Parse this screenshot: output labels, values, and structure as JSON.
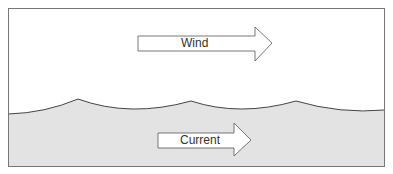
{
  "diagram": {
    "wind": {
      "label": "Wind",
      "direction": "right"
    },
    "current": {
      "label": "Current",
      "direction": "right"
    },
    "colors": {
      "air": "#ffffff",
      "water": "#e3e3e3",
      "outline": "#555555",
      "arrow_fill": "#ffffff"
    }
  }
}
